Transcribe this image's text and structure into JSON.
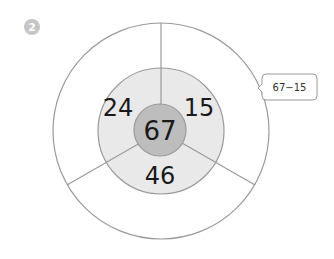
{
  "problem": {
    "badge_number": "2"
  },
  "diagram": {
    "center_value": "67",
    "middle_values": {
      "upper_left": "24",
      "upper_right": "15",
      "bottom": "46"
    },
    "outer_values": {
      "upper_left": "",
      "upper_right": "",
      "bottom": ""
    },
    "callout": {
      "text": "67−15"
    },
    "colors": {
      "inner_fill": "#bdbdbd",
      "middle_fill": "#e9e9e9",
      "outer_fill": "#ffffff",
      "stroke": "#9a9a9a",
      "badge_fill": "#c6c6c6"
    }
  }
}
